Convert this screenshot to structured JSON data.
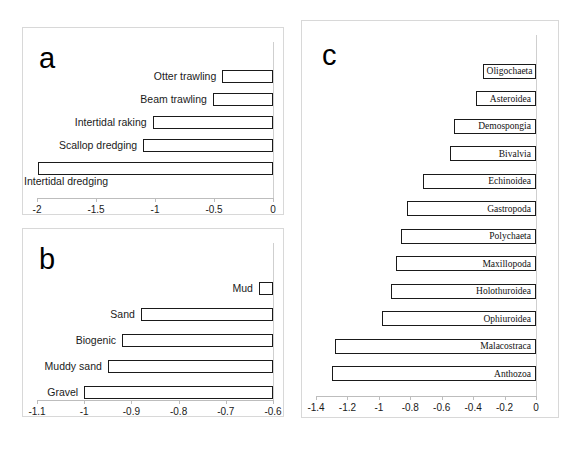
{
  "figure": {
    "background": "#ffffff",
    "bar_fill": "#ffffff",
    "bar_stroke": "#1a1a1a",
    "panel_border": "#d8d8d8",
    "axis_color": "#bdbdbd"
  },
  "panels": [
    {
      "id": "a",
      "letter": "a",
      "label_position": "outside-left"
    },
    {
      "id": "b",
      "letter": "b",
      "label_position": "outside-left"
    },
    {
      "id": "c",
      "letter": "c",
      "label_position": "inside-right"
    }
  ],
  "chart_data": [
    {
      "type": "bar",
      "orientation": "horizontal",
      "panel": "a",
      "title": "a",
      "xlabel": "",
      "ylabel": "",
      "xlim": [
        -2,
        0
      ],
      "grid": false,
      "legend": "none",
      "tick_labels": [
        "-2",
        "-1.5",
        "-1",
        "-0.5",
        "0"
      ],
      "ticks": [
        -2,
        -1.5,
        -1,
        -0.5,
        0
      ],
      "categories": [
        "Otter trawling",
        "Beam trawling",
        "Intertidal raking",
        "Scallop dredging",
        "Intertidal dredging"
      ],
      "values": [
        -0.43,
        -0.51,
        -1.02,
        -1.1,
        -1.99
      ]
    },
    {
      "type": "bar",
      "orientation": "horizontal",
      "panel": "b",
      "title": "b",
      "xlabel": "",
      "ylabel": "",
      "xlim": [
        -1.1,
        -0.6
      ],
      "grid": false,
      "legend": "none",
      "tick_labels": [
        "-1.1",
        "-1",
        "-0.9",
        "-0.8",
        "-0.7",
        "-0.6"
      ],
      "ticks": [
        -1.1,
        -1,
        -0.9,
        -0.8,
        -0.7,
        -0.6
      ],
      "categories": [
        "Mud",
        "Sand",
        "Biogenic",
        "Muddy sand",
        "Gravel"
      ],
      "values": [
        -0.63,
        -0.88,
        -0.92,
        -0.95,
        -1.0
      ]
    },
    {
      "type": "bar",
      "orientation": "horizontal",
      "panel": "c",
      "title": "c",
      "xlabel": "",
      "ylabel": "",
      "xlim": [
        -1.4,
        0
      ],
      "grid": false,
      "legend": "none",
      "tick_labels": [
        "-1.4",
        "-1.2",
        "-1",
        "-0.8",
        "-0.6",
        "-0.4",
        "-0.2",
        "0"
      ],
      "ticks": [
        -1.4,
        -1.2,
        -1,
        -0.8,
        -0.6,
        -0.4,
        -0.2,
        0
      ],
      "categories": [
        "Oligochaeta",
        "Asteroidea",
        "Demospongia",
        "Bivalvia",
        "Echinoidea",
        "Gastropoda",
        "Polychaeta",
        "Maxillopoda",
        "Holothuroidea",
        "Ophiuroidea",
        "Malacostraca",
        "Anthozoa"
      ],
      "values": [
        -0.34,
        -0.38,
        -0.52,
        -0.55,
        -0.72,
        -0.82,
        -0.86,
        -0.89,
        -0.92,
        -0.98,
        -1.28,
        -1.3
      ]
    }
  ]
}
